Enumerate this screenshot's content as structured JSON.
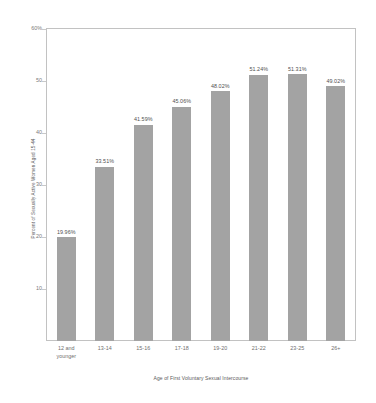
{
  "chart_data": {
    "type": "bar",
    "title": "",
    "xlabel": "Age of First Voluntary Sexual Intercourse",
    "ylabel": "Percent of Sexually Active Women Aged 15-44",
    "categories": [
      "12 and younger",
      "13-14",
      "15-16",
      "17-18",
      "19-20",
      "21-22",
      "23-25",
      "26+"
    ],
    "values": [
      19.96,
      33.51,
      41.59,
      45.06,
      48.02,
      51.24,
      51.31,
      49.02
    ],
    "value_labels": [
      "19.96%",
      "33.51%",
      "41.59%",
      "45.06%",
      "48.02%",
      "51.24%",
      "51.31%",
      "49.02%"
    ],
    "ylim": [
      0,
      60
    ],
    "ytick_values": [
      60,
      50,
      40,
      30,
      20,
      10
    ],
    "ytick_labels": [
      "60%",
      "50",
      "40",
      "30",
      "20",
      "10"
    ],
    "grid": false,
    "legend": null,
    "bar_color": "#a3a3a3",
    "axis_color": "#c2c2c2",
    "text_color": "#5a5a5a",
    "background": "#ffffff"
  },
  "x_axis": {
    "tick_lines": [
      [
        "12 and",
        "younger"
      ],
      [
        "13-14",
        ""
      ],
      [
        "15-16",
        ""
      ],
      [
        "17-18",
        ""
      ],
      [
        "19-20",
        ""
      ],
      [
        "21-22",
        ""
      ],
      [
        "23-25",
        ""
      ],
      [
        "26+",
        ""
      ]
    ]
  }
}
